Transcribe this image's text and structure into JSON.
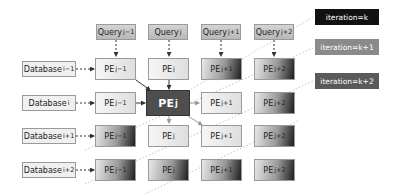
{
  "queries": [
    {
      "label": "Query",
      "sub": "j−1"
    },
    {
      "label": "Query",
      "sub": "j"
    },
    {
      "label": "Query",
      "sub": "j+1"
    },
    {
      "label": "Query",
      "sub": "j+2"
    }
  ],
  "databases": [
    {
      "label": "Database",
      "sub": "i−1"
    },
    {
      "label": "Database",
      "sub": "i"
    },
    {
      "label": "Database",
      "sub": "i+1"
    },
    {
      "label": "Database",
      "sub": "i+2"
    }
  ],
  "pe_grid": [
    [
      {
        "label": "PE",
        "sub": "j−1",
        "style": "light"
      },
      {
        "label": "PE",
        "sub": "j",
        "style": "light"
      },
      {
        "label": "PE",
        "sub": "j+1",
        "style": "dark"
      },
      {
        "label": "PE",
        "sub": "j+2",
        "style": "dark"
      }
    ],
    [
      {
        "label": "PE",
        "sub": "j−1",
        "style": "light"
      },
      {
        "label": "PE",
        "sub": "j",
        "style": "center"
      },
      {
        "label": "PE",
        "sub": "j+1",
        "style": "light"
      },
      {
        "label": "PE",
        "sub": "j+2",
        "style": "dark"
      }
    ],
    [
      {
        "label": "PE",
        "sub": "j−1",
        "style": "dark"
      },
      {
        "label": "PE",
        "sub": "j",
        "style": "light"
      },
      {
        "label": "PE",
        "sub": "j+1",
        "style": "light"
      },
      {
        "label": "PE",
        "sub": "j+2",
        "style": "dark"
      }
    ],
    [
      {
        "label": "PE",
        "sub": "j−1",
        "style": "dark"
      },
      {
        "label": "PE",
        "sub": "j",
        "style": "dark"
      },
      {
        "label": "PE",
        "sub": "j+1",
        "style": "dark"
      },
      {
        "label": "PE",
        "sub": "j+2",
        "style": "dark"
      }
    ]
  ],
  "legend": [
    {
      "label": "iteration=k",
      "color": "#111111"
    },
    {
      "label": "iteration=k+1",
      "color": "#8a8a8a"
    },
    {
      "label": "iteration=k+2",
      "color": "#5a5a5a"
    }
  ]
}
